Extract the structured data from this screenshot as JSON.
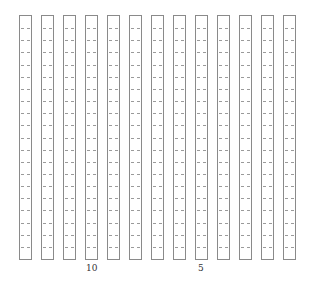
{
  "diagram": {
    "type": "column-grid",
    "column_count": 13,
    "rows_per_column": 20,
    "line_color": "#8a8a8a",
    "dash_color": "#9a9a9a",
    "labels": [
      {
        "text": "10",
        "column_index": 3
      },
      {
        "text": "5",
        "column_index": 8
      }
    ]
  }
}
